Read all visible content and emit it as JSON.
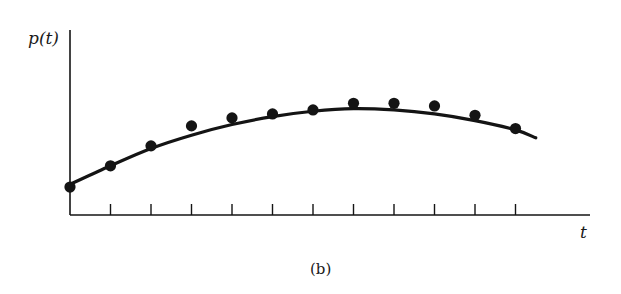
{
  "figure": {
    "caption": "(b)",
    "ylabel": "p(t)",
    "xlabel": "t"
  },
  "colors": {
    "ink": "#141414",
    "background": "#ffffff"
  },
  "chart_data": {
    "type": "scatter",
    "title": "",
    "caption": "(b)",
    "xlabel": "t",
    "ylabel": "p(t)",
    "grid": false,
    "legend": null,
    "x_ticks": 11,
    "x_tick_labels": [],
    "y_tick_labels": [],
    "note": "No numeric tick labels shown; values are relative (t = tick index, p on 0-10 scale estimated from pixel height above x-axis).",
    "xlim": [
      0,
      12.8
    ],
    "ylim": [
      0,
      10
    ],
    "series": [
      {
        "name": "observations",
        "kind": "scatter",
        "x": [
          0,
          1,
          2,
          3,
          4,
          5,
          6,
          7,
          8,
          9,
          10,
          11
        ],
        "y": [
          2.1,
          3.7,
          5.2,
          6.7,
          7.3,
          7.6,
          7.9,
          8.4,
          8.4,
          8.2,
          7.5,
          6.5
        ]
      },
      {
        "name": "fitted curve",
        "kind": "line",
        "x": [
          0,
          1,
          2,
          3,
          4,
          5,
          6,
          7,
          8,
          9,
          10,
          11,
          11.5
        ],
        "y": [
          2.3,
          3.7,
          5.0,
          6.0,
          6.8,
          7.4,
          7.8,
          8.0,
          7.9,
          7.6,
          7.1,
          6.4,
          5.8
        ]
      }
    ]
  }
}
